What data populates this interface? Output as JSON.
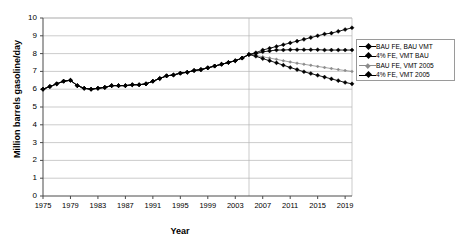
{
  "chart_data": {
    "type": "line",
    "title": "",
    "xlabel": "Year",
    "ylabel": "Million barrels gasoline/day",
    "xlim": [
      1975,
      2020
    ],
    "ylim": [
      0,
      10
    ],
    "grid": true,
    "legend_position": "right",
    "ytick_labels": [
      "0",
      "1",
      "2",
      "3",
      "4",
      "5",
      "6",
      "7",
      "8",
      "9",
      "10"
    ],
    "ytick_values": [
      0,
      1,
      2,
      3,
      4,
      5,
      6,
      7,
      8,
      9,
      10
    ],
    "xtick_labels": [
      "1975",
      "1979",
      "1983",
      "1987",
      "1991",
      "1995",
      "1999",
      "2003",
      "2007",
      "2011",
      "2015",
      "2019"
    ],
    "xtick_values": [
      1975,
      1979,
      1983,
      1987,
      1991,
      1995,
      1999,
      2003,
      2007,
      2011,
      2015,
      2019
    ],
    "x": [
      1975,
      1976,
      1977,
      1978,
      1979,
      1980,
      1981,
      1982,
      1983,
      1984,
      1985,
      1986,
      1987,
      1988,
      1989,
      1990,
      1991,
      1992,
      1993,
      1994,
      1995,
      1996,
      1997,
      1998,
      1999,
      2000,
      2001,
      2002,
      2003,
      2004,
      2005,
      2006,
      2007,
      2008,
      2009,
      2010,
      2011,
      2012,
      2013,
      2014,
      2015,
      2016,
      2017,
      2018,
      2019,
      2020
    ],
    "series": [
      {
        "name": "BAU FE, BAU VMT",
        "color": "#000000",
        "marker": "diamond",
        "values": [
          6.0,
          6.15,
          6.3,
          6.45,
          6.5,
          6.2,
          6.05,
          6.0,
          6.05,
          6.1,
          6.2,
          6.2,
          6.2,
          6.25,
          6.25,
          6.3,
          6.45,
          6.6,
          6.75,
          6.8,
          6.9,
          6.95,
          7.05,
          7.1,
          7.2,
          7.3,
          7.4,
          7.5,
          7.6,
          7.75,
          7.95,
          8.05,
          8.2,
          8.3,
          8.4,
          8.5,
          8.6,
          8.7,
          8.8,
          8.9,
          9.0,
          9.1,
          9.15,
          9.25,
          9.35,
          9.45
        ]
      },
      {
        "name": "4% FE, VMT BAU",
        "color": "#000000",
        "marker": "diamond",
        "values": [
          6.0,
          6.15,
          6.3,
          6.45,
          6.5,
          6.2,
          6.05,
          6.0,
          6.05,
          6.1,
          6.2,
          6.2,
          6.2,
          6.25,
          6.25,
          6.3,
          6.45,
          6.6,
          6.75,
          6.8,
          6.9,
          6.95,
          7.05,
          7.1,
          7.2,
          7.3,
          7.4,
          7.5,
          7.6,
          7.75,
          7.95,
          8.0,
          8.1,
          8.15,
          8.2,
          8.2,
          8.22,
          8.22,
          8.22,
          8.22,
          8.22,
          8.2,
          8.2,
          8.2,
          8.2,
          8.2
        ]
      },
      {
        "name": "BAU FE, VMT 2005",
        "color": "#8c8c8c",
        "marker": "diamond",
        "values": [
          6.0,
          6.15,
          6.3,
          6.45,
          6.5,
          6.2,
          6.05,
          6.0,
          6.05,
          6.1,
          6.2,
          6.2,
          6.2,
          6.25,
          6.25,
          6.3,
          6.45,
          6.6,
          6.75,
          6.8,
          6.9,
          6.95,
          7.05,
          7.1,
          7.2,
          7.3,
          7.4,
          7.5,
          7.6,
          7.75,
          7.95,
          7.9,
          7.82,
          7.75,
          7.68,
          7.6,
          7.53,
          7.46,
          7.4,
          7.34,
          7.28,
          7.22,
          7.16,
          7.1,
          7.05,
          7.0
        ]
      },
      {
        "name": "4% FE, VMT 2005",
        "color": "#000000",
        "marker": "diamond",
        "values": [
          6.0,
          6.15,
          6.3,
          6.45,
          6.5,
          6.2,
          6.05,
          6.0,
          6.05,
          6.1,
          6.2,
          6.2,
          6.2,
          6.25,
          6.25,
          6.3,
          6.45,
          6.6,
          6.75,
          6.8,
          6.9,
          6.95,
          7.05,
          7.1,
          7.2,
          7.3,
          7.4,
          7.5,
          7.6,
          7.75,
          7.95,
          7.85,
          7.72,
          7.6,
          7.48,
          7.35,
          7.22,
          7.1,
          6.98,
          6.88,
          6.78,
          6.68,
          6.58,
          6.48,
          6.38,
          6.3
        ]
      }
    ],
    "annotations": {
      "vertical_divider_year": 2005
    }
  }
}
